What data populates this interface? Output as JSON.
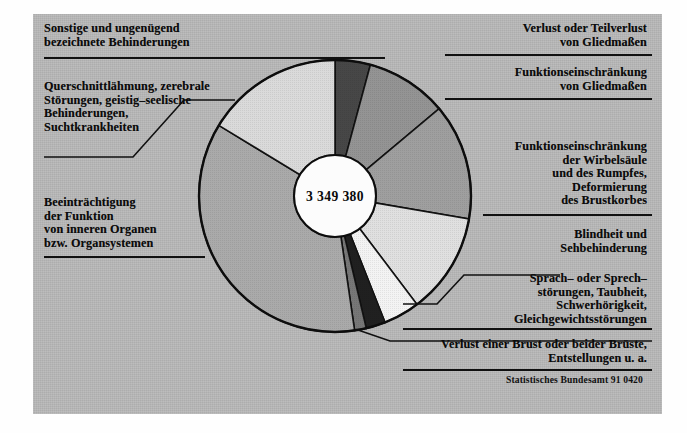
{
  "figure": {
    "center_value": "3 349 380",
    "source": "Statistisches Bundesamt 91 0420",
    "background_color": "#b9b9b9",
    "line_color": "#101010"
  },
  "labels": {
    "top_left": "Sonstige und ungenügend\nbezeichnete Behinderungen",
    "left_upper": "Querschnittlähmung, zerebrale\nStörungen, geistig–seelische\nBehinderungen,\nSuchtkrankheiten",
    "left_lower": "Beeinträchtigung\nder Funktion\nvon inneren Organen\nbzw. Organsystemen",
    "right_1": "Verlust oder Teilverlust\nvon Gliedmaßen",
    "right_2": "Funktionseinschränkung\nvon Gliedmaßen",
    "right_3": "Funktionseinschränkung\nder Wirbelsäule\nund des Rumpfes,\nDeformierung\ndes Brustkorbes",
    "right_4": "Blindheit und\nSehbehinderung",
    "right_5": "Sprach– oder Sprech–\nstörungen, Taubheit,\nSchwerhörigkeit,\nGleichgewichtsstörungen",
    "bottom_right": "Verlust einer Brust oder beider Brüste,\nEntstellungen u. a."
  },
  "chart_data": {
    "type": "pie",
    "title": "",
    "center_label": "3 349 380",
    "total": 3349380,
    "units": "Personen",
    "donut": true,
    "inner_radius_ratio": 0.3,
    "start_angle_deg": -90,
    "direction": "clockwise",
    "categories": [
      "Sonstige und ungenügend bezeichnete Behinderungen",
      "Verlust oder Teilverlust von Gliedmaßen",
      "Funktionseinschränkung von Gliedmaßen",
      "Funktionseinschränkung der Wirbelsäule und des Rumpfes, Deformierung des Brustkorbes",
      "Blindheit und Sehbehinderung",
      "Sprach– oder Sprechstörungen, Taubheit, Schwerhörigkeit, Gleichgewichtsstörungen",
      "Verlust einer Brust oder beider Brüste, Entstellungen u. a.",
      "Beeinträchtigung der Funktion von inneren Organen bzw. Organsystemen",
      "Querschnittlähmung, zerebrale Störungen, geistig–seelische Behinderungen, Suchtkrankheiten"
    ],
    "values": [
      4.2,
      9.7,
      13.8,
      12.0,
      4.3,
      2.3,
      1.4,
      36.0,
      16.3
    ],
    "value_unit": "percent",
    "segments": [
      {
        "name": "Sonstige und ungenügend bezeichnete Behinderungen",
        "percent": 4.2,
        "start_deg": -90.0,
        "end_deg": -74.9,
        "fill": "#3d3d3d"
      },
      {
        "name": "Verlust oder Teilverlust von Gliedmaßen",
        "percent": 9.7,
        "start_deg": -74.9,
        "end_deg": -40.0,
        "fill": "#8e8e8e"
      },
      {
        "name": "Funktionseinschränkung von Gliedmaßen",
        "percent": 13.8,
        "start_deg": -40.0,
        "end_deg": 9.7,
        "fill": "#9a9a9a"
      },
      {
        "name": "Funktionseinschränkung der Wirbelsäule und des Rumpfes, Deformierung des Brustkorbes",
        "percent": 12.0,
        "start_deg": 9.7,
        "end_deg": 52.9,
        "fill": "#dedede"
      },
      {
        "name": "Blindheit und Sehbehinderung",
        "percent": 4.3,
        "start_deg": 52.9,
        "end_deg": 68.4,
        "fill": "#f2f2f2"
      },
      {
        "name": "Sprach– oder Sprechstörungen, Taubheit, Schwerhörigkeit, Gleichgewichtsstörungen",
        "percent": 2.3,
        "start_deg": 68.4,
        "end_deg": 76.7,
        "fill": "#141414"
      },
      {
        "name": "Verlust einer Brust oder beider Brüste, Entstellungen u. a.",
        "percent": 1.4,
        "start_deg": 76.7,
        "end_deg": 81.7,
        "fill": "#707070"
      },
      {
        "name": "Beeinträchtigung der Funktion von inneren Organen bzw. Organsystemen",
        "percent": 36.0,
        "start_deg": 81.7,
        "end_deg": 211.3,
        "fill": "#a5a5a5"
      },
      {
        "name": "Querschnittlähmung, zerebrale Störungen, geistig–seelische Behinderungen, Suchtkrankheiten",
        "percent": 16.3,
        "start_deg": 211.3,
        "end_deg": 270.0,
        "fill": "#d8d8d8"
      }
    ],
    "legend": "callout labels around pie",
    "grid": false
  }
}
